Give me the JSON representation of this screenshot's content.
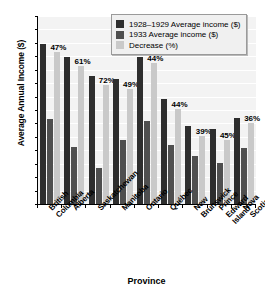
{
  "chart_data": {
    "type": "bar",
    "title": "",
    "xlabel": "Province",
    "ylabel": "Average Annual Income ($)",
    "ylim": [
      0,
      700
    ],
    "ytick_step": 50,
    "yticks": [
      0,
      50,
      100,
      150,
      200,
      250,
      300,
      350,
      400,
      450,
      500,
      550,
      600,
      650,
      700
    ],
    "grid": true,
    "legend_position": "top-right",
    "categories": [
      "British Columbia",
      "Alberta",
      "Saskatchewan",
      "Manitoba",
      "Ontario",
      "Québec",
      "New Brunswick",
      "Prince Edward Island",
      "Nova Scotia"
    ],
    "series": [
      {
        "name": "1928–1929 Average income ($)",
        "color": "#2e2e2e",
        "values": [
          595,
          548,
          478,
          466,
          549,
          391,
          292,
          278,
          322
        ]
      },
      {
        "name": "1933 Average income ($)",
        "color": "#4f4f4f",
        "values": [
          315,
          212,
          135,
          240,
          310,
          220,
          180,
          154,
          207
        ]
      },
      {
        "name": "Decrease (%)",
        "color": "#c9c9c9",
        "values": [
          47,
          61,
          72,
          49,
          44,
          44,
          39,
          45,
          36
        ],
        "unit": "%",
        "plotted_scale": [
          565,
          515,
          445,
          430,
          525,
          355,
          255,
          240,
          300
        ]
      }
    ],
    "annotations": [
      "47%",
      "61%",
      "72%",
      "49%",
      "44%",
      "44%",
      "39%",
      "45%",
      "36%"
    ]
  },
  "legend": {
    "items": [
      {
        "label": "1928–1929 Average income ($)",
        "color": "#2e2e2e"
      },
      {
        "label": "1933 Average income ($)",
        "color": "#4f4f4f"
      },
      {
        "label": "Decrease (%)",
        "color": "#c9c9c9"
      }
    ]
  },
  "axes": {
    "y_title": "Average Annual Income ($)",
    "x_title": "Province"
  }
}
